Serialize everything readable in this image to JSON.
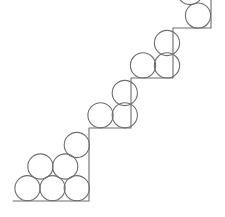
{
  "figure": {
    "canvas": {
      "width": 225,
      "height": 217
    },
    "background_color": "#ffffff",
    "stroke_color": "#6e6e6e",
    "stroke_width": 1.1,
    "fill": "none",
    "circle_radius": 12.6,
    "circle_diameter": 25.2,
    "step_rise": 50,
    "step_run": 42,
    "circle_count": 12,
    "staircase": {
      "name": "staircase-outline",
      "points": "13,201 89,201 89,128 131,128 131,78 173,78 173,28 211,28 211,0",
      "vertices": [
        {
          "label": "baseline-left-end",
          "x": 13,
          "y": 201
        },
        {
          "label": "step1-inner-corner",
          "x": 89,
          "y": 201
        },
        {
          "label": "step1-top",
          "x": 89,
          "y": 128
        },
        {
          "label": "step2-inner-corner",
          "x": 131,
          "y": 128
        },
        {
          "label": "step2-top",
          "x": 131,
          "y": 78
        },
        {
          "label": "step3-inner-corner",
          "x": 173,
          "y": 78
        },
        {
          "label": "step3-top",
          "x": 173,
          "y": 28
        },
        {
          "label": "step4-inner-corner",
          "x": 211,
          "y": 28
        },
        {
          "label": "step4-top-end",
          "x": 211,
          "y": 0
        }
      ]
    },
    "circles": [
      {
        "id": "c1",
        "group": "step-1",
        "row": "bottom",
        "cx": 27.5,
        "cy": 188.2,
        "r": 12.6
      },
      {
        "id": "c2",
        "group": "step-1",
        "row": "bottom",
        "cx": 52.5,
        "cy": 188.2,
        "r": 12.6
      },
      {
        "id": "c3",
        "group": "step-1",
        "row": "bottom",
        "cx": 76.8,
        "cy": 188.2,
        "r": 12.6
      },
      {
        "id": "c4",
        "group": "step-1",
        "row": "middle",
        "cx": 40.4,
        "cy": 166.5,
        "r": 12.6
      },
      {
        "id": "c5",
        "group": "step-1",
        "row": "middle",
        "cx": 65.2,
        "cy": 166.5,
        "r": 12.6
      },
      {
        "id": "c6",
        "group": "step-1",
        "row": "top",
        "cx": 76.8,
        "cy": 145.0,
        "r": 12.6
      },
      {
        "id": "c7",
        "group": "step-2",
        "row": "bottom",
        "cx": 100.5,
        "cy": 115.3,
        "r": 12.6
      },
      {
        "id": "c8",
        "group": "step-2",
        "row": "bottom",
        "cx": 124.8,
        "cy": 115.3,
        "r": 12.6
      },
      {
        "id": "c9",
        "group": "step-2",
        "row": "top",
        "cx": 124.8,
        "cy": 93.0,
        "r": 12.6
      },
      {
        "id": "c10",
        "group": "step-3",
        "row": "bottom",
        "cx": 143.0,
        "cy": 65.4,
        "r": 12.6
      },
      {
        "id": "c11",
        "group": "step-3",
        "row": "bottom",
        "cx": 167.0,
        "cy": 65.4,
        "r": 12.6
      },
      {
        "id": "c12",
        "group": "step-3",
        "row": "top",
        "cx": 167.0,
        "cy": 43.0,
        "r": 12.6
      },
      {
        "id": "c13",
        "group": "step-4",
        "row": "bottom",
        "cx": 198.0,
        "cy": 15.6,
        "r": 12.6
      },
      {
        "id": "c14",
        "group": "step-4",
        "row": "top",
        "cx": 190.0,
        "cy": -8.0,
        "r": 12.6
      }
    ]
  }
}
